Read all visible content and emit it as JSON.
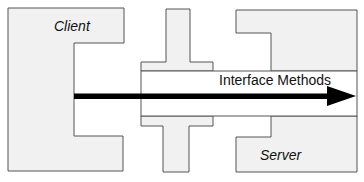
{
  "diagram": {
    "colors": {
      "shape_fill": "#f1f1f1",
      "shape_stroke": "#555555",
      "band_fill": "#ffffff",
      "arrow": "#000000",
      "background": "#ffffff"
    },
    "client": {
      "label": "Client"
    },
    "server": {
      "label": "Server"
    },
    "interface": {
      "label": "Interface Methods"
    },
    "arrow": {
      "direction": "client-to-server"
    }
  }
}
